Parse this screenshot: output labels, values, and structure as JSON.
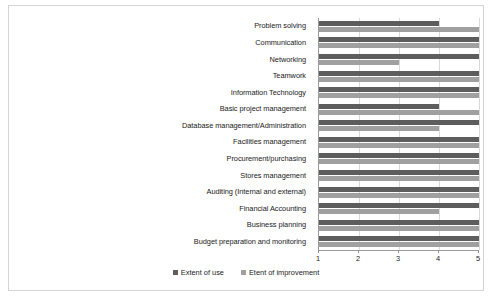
{
  "chart_data": {
    "type": "bar",
    "orientation": "horizontal",
    "title": "",
    "subtitle": "",
    "xlabel": "",
    "ylabel": "",
    "xlim": [
      1,
      5
    ],
    "xticks": [
      1,
      2,
      3,
      4,
      5
    ],
    "xtick_labels": [
      "1",
      "2",
      "3",
      "4",
      "5"
    ],
    "grid": true,
    "grid_axis": "x",
    "legend_position": "bottom-center",
    "categories": [
      "Problem solving",
      "Communication",
      "Networking",
      "Teamwork",
      "Information Technology",
      "Basic project management",
      "Database management/Administration",
      "Facilities management",
      "Procurement/purchasing",
      "Stores management",
      "Auditing (Internal and external)",
      "Financial Accounting",
      "Business planning",
      "Budget preparation and monitoring"
    ],
    "series": [
      {
        "name": "Extent of use",
        "color": "#5d5d5d",
        "values": [
          4,
          5,
          5,
          5,
          5,
          4,
          5,
          5,
          5,
          5,
          5,
          5,
          5,
          5
        ]
      },
      {
        "name": "Etent of improvement",
        "color": "#a0a0a0",
        "values": [
          5,
          5,
          3,
          5,
          5,
          5,
          4,
          5,
          5,
          5,
          5,
          4,
          5,
          5
        ]
      }
    ]
  },
  "legend": {
    "entries": [
      {
        "label": "Extent of use",
        "swatch": "series-use"
      },
      {
        "label": "Etent of improvement",
        "swatch": "series-improve"
      }
    ]
  },
  "colors": {
    "series_use": "#5d5d5d",
    "series_improve": "#a0a0a0",
    "axis": "#9a9a9a",
    "gridline": "#d9d9d9",
    "frame": "#d4d4d4"
  }
}
